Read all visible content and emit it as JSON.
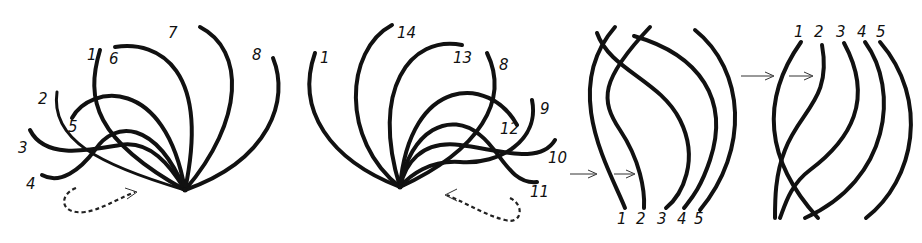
{
  "diagram": {
    "panels": [
      {
        "id": "fan-left",
        "labels": [
          "1",
          "2",
          "3",
          "4",
          "5",
          "6",
          "7",
          "8"
        ],
        "direction_arrow": "dashed curved arrow pointing right (clockwise order)"
      },
      {
        "id": "fan-right",
        "labels": [
          "1",
          "14",
          "13",
          "8",
          "9",
          "12",
          "10",
          "11"
        ],
        "direction_arrow": "dashed curved arrow pointing left (counterclockwise order)"
      },
      {
        "id": "strands-a",
        "labels": [
          "1",
          "2",
          "3",
          "4",
          "5"
        ],
        "pointer_arrows": 2,
        "label_position": "bottom"
      },
      {
        "id": "strands-b",
        "labels": [
          "1",
          "2",
          "3",
          "4",
          "5"
        ],
        "pointer_arrows": 2,
        "label_position": "top"
      }
    ]
  },
  "labels": {
    "p1": {
      "l1": "1",
      "l2": "2",
      "l3": "3",
      "l4": "4",
      "l5": "5",
      "l6": "6",
      "l7": "7",
      "l8": "8"
    },
    "p2": {
      "l1": "1",
      "l14": "14",
      "l13": "13",
      "l8": "8",
      "l9": "9",
      "l12": "12",
      "l10": "10",
      "l11": "11"
    },
    "p3": {
      "l1": "1",
      "l2": "2",
      "l3": "3",
      "l4": "4",
      "l5": "5"
    },
    "p4": {
      "l1": "1",
      "l2": "2",
      "l3": "3",
      "l4": "4",
      "l5": "5"
    }
  },
  "colors": {
    "ink": "#111111",
    "background": "#ffffff"
  }
}
